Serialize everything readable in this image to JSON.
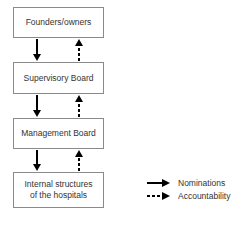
{
  "diagram": {
    "boxes": [
      {
        "id": "founders",
        "label": "Founders/owners"
      },
      {
        "id": "supervisory",
        "label": "Supervisory Board"
      },
      {
        "id": "management",
        "label": "Management Board"
      },
      {
        "id": "internal",
        "label": "Internal structures\nof the hospitals"
      }
    ],
    "edges": [
      {
        "from": "founders",
        "to": "supervisory",
        "type": "nominations"
      },
      {
        "from": "supervisory",
        "to": "founders",
        "type": "accountability"
      },
      {
        "from": "supervisory",
        "to": "management",
        "type": "nominations"
      },
      {
        "from": "management",
        "to": "supervisory",
        "type": "accountability"
      },
      {
        "from": "management",
        "to": "internal",
        "type": "nominations"
      },
      {
        "from": "internal",
        "to": "management",
        "type": "accountability"
      }
    ]
  },
  "legend": {
    "nominations": "Nominations",
    "accountability": "Accountability"
  },
  "colors": {
    "box_border": "#8a8a8a",
    "arrow": "#000000",
    "text": "#333333"
  }
}
